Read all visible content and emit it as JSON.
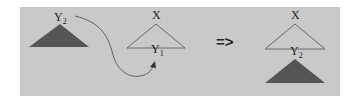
{
  "diagram": {
    "title": "",
    "colors": {
      "background": "#ffffff",
      "panel": "#c9c9c9",
      "filled_triangle": "#555555",
      "outline": "#6a6a6a",
      "curve": "#555555",
      "text": "#222222"
    },
    "left": {
      "subtree": {
        "label": "Y",
        "subscript": "2",
        "style": "filled"
      },
      "tree": {
        "root_label": "X",
        "leaf_label": "Y",
        "leaf_subscript": "1",
        "style": "outline"
      },
      "arrow": {
        "type": "curved",
        "from": "Y2",
        "to": "Y1"
      }
    },
    "transform_symbol": "=>",
    "right": {
      "tree": {
        "root_label": "X",
        "leaf_label": "Y",
        "leaf_subscript": "2",
        "style": "outline"
      },
      "subtree": {
        "style": "filled",
        "attached_at": "Y2"
      }
    }
  }
}
